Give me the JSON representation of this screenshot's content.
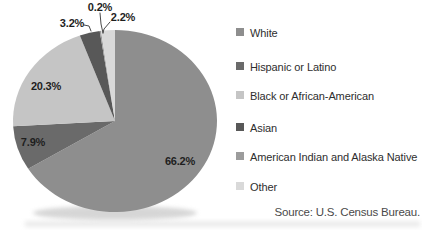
{
  "chart_data": {
    "type": "pie",
    "title": "",
    "direction": "clockwise",
    "start_angle_deg": 0,
    "legend_position": "right",
    "slices": [
      {
        "label": "White",
        "value": 66.2,
        "display": "66.2%",
        "color": "#8E8E8E"
      },
      {
        "label": "Hispanic or Latino",
        "value": 7.9,
        "display": "7.9%",
        "color": "#6A6A6A"
      },
      {
        "label": "Black or African-American",
        "value": 20.3,
        "display": "20.3%",
        "color": "#C5C5C5"
      },
      {
        "label": "Asian",
        "value": 3.2,
        "display": "3.2%",
        "color": "#585858"
      },
      {
        "label": "American Indian and Alaska Native",
        "value": 0.2,
        "display": "0.2%",
        "color": "#9C9C9C"
      },
      {
        "label": "Other",
        "value": 2.2,
        "display": "2.2%",
        "color": "#D9D9D9"
      }
    ],
    "source_note": "Source: U.S. Census Bureau."
  }
}
